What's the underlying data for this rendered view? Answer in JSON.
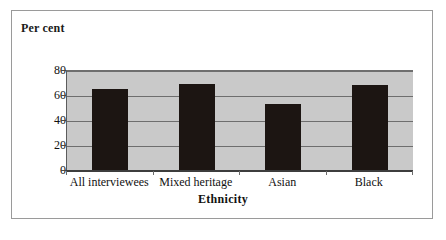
{
  "figure": {
    "background_color": "#ffffff",
    "border_color": "#9a9a9a",
    "plot_background_color": "#c9c9c9",
    "bar_color": "#1c1512",
    "gridline_color": "#6e6e6e"
  },
  "chart_data": {
    "type": "bar",
    "title": "",
    "xlabel": "Ethnicity",
    "ylabel": "Per cent",
    "categories": [
      "All interviewees",
      "Mixed heritage",
      "Asian",
      "Black"
    ],
    "values": [
      66,
      70,
      54,
      69
    ],
    "ylim": [
      0,
      80
    ],
    "yticks": [
      0,
      20,
      40,
      60,
      80
    ],
    "ytick_labels": [
      "0",
      "20",
      "40",
      "60",
      "80"
    ],
    "grid": true,
    "legend": "none",
    "series": [
      {
        "name": "Per cent",
        "values": [
          66,
          70,
          54,
          69
        ]
      }
    ]
  }
}
